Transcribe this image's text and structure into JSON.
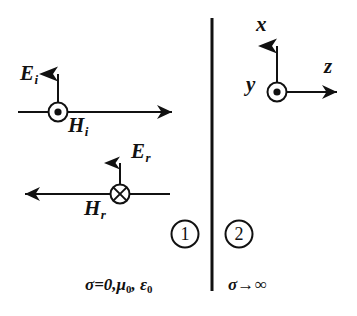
{
  "figure": {
    "kind": "physics-diagram",
    "background_color": "#ffffff",
    "ink_color": "#111111"
  },
  "boundary": {
    "name": "interface-line",
    "x": 212,
    "y_top": 18,
    "y_bottom": 291
  },
  "regions": [
    {
      "badge": "1",
      "badge_cx": 185,
      "badge_cy": 234,
      "properties": "σ=0,μ",
      "properties_sub1": "0",
      "properties_mid": ", ε",
      "properties_sub2": "0",
      "properties_full": "σ=0,μ₀, ε₀"
    },
    {
      "badge": "2",
      "badge_cx": 239,
      "badge_cy": 234,
      "properties": "σ→∞",
      "properties_full": "σ→∞"
    }
  ],
  "waves": [
    {
      "name": "incident-wave",
      "propagation_direction": "right",
      "ray_y": 112,
      "ray_x_start": 18,
      "ray_x_end": 175,
      "E_label": "E",
      "E_sub": "i",
      "E_arrow_direction": "up",
      "E_arrow_x": 58,
      "E_arrow_y_base": 112,
      "E_arrow_y_tip": 58,
      "H_label": "H",
      "H_sub": "i",
      "H_symbol": "circle-dot",
      "H_symbol_meaning": "out-of-page",
      "H_symbol_cx": 58,
      "H_symbol_cy": 112
    },
    {
      "name": "reflected-wave",
      "propagation_direction": "left",
      "ray_y": 194,
      "ray_x_start": 22,
      "ray_x_end": 170,
      "E_label": "E",
      "E_sub": "r",
      "E_arrow_direction": "up",
      "E_arrow_x": 120,
      "E_arrow_y_base": 194,
      "E_arrow_y_tip": 147,
      "H_label": "H",
      "H_sub": "r",
      "H_symbol": "circle-cross",
      "H_symbol_meaning": "into-page",
      "H_symbol_cx": 120,
      "H_symbol_cy": 194
    }
  ],
  "axes": {
    "name": "coordinate-triad",
    "origin_x": 277,
    "origin_y": 92,
    "x_axis": {
      "label": "x",
      "direction": "up",
      "tip_y": 30
    },
    "y_axis": {
      "label": "y",
      "direction": "out-of-page",
      "symbol": "circle-dot"
    },
    "z_axis": {
      "label": "z",
      "direction": "right",
      "tip_x": 340
    }
  }
}
